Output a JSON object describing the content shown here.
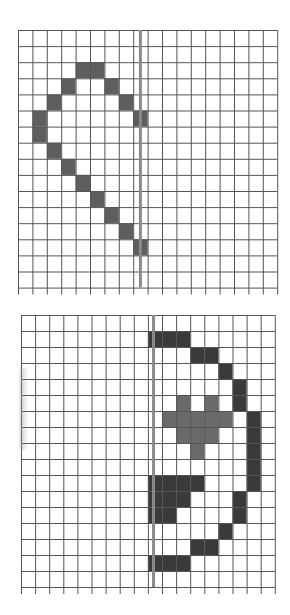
{
  "colors": {
    "grid_line": "#555555",
    "mirror_line": "#8a8a8a",
    "cell_dark": "#3a3a3a",
    "cell_medium": "#6a6a6a",
    "cell_top": "#5e5e5e",
    "background": "#ffffff"
  },
  "grids": [
    {
      "id": "top-grid",
      "x": 18,
      "y": 30,
      "cols": 18,
      "rows": 16,
      "cell_w": 14.4,
      "cell_h": 16.1,
      "mirror_x_col": 8.5,
      "cells": [
        {
          "r": 2,
          "c": 4,
          "tone": "top"
        },
        {
          "r": 2,
          "c": 5,
          "tone": "top"
        },
        {
          "r": 3,
          "c": 3,
          "tone": "top"
        },
        {
          "r": 3,
          "c": 6,
          "tone": "top"
        },
        {
          "r": 4,
          "c": 2,
          "tone": "top"
        },
        {
          "r": 4,
          "c": 7,
          "tone": "top"
        },
        {
          "r": 5,
          "c": 1,
          "tone": "top"
        },
        {
          "r": 5,
          "c": 8,
          "tone": "top"
        },
        {
          "r": 6,
          "c": 1,
          "tone": "top"
        },
        {
          "r": 7,
          "c": 2,
          "tone": "top"
        },
        {
          "r": 8,
          "c": 3,
          "tone": "top"
        },
        {
          "r": 9,
          "c": 4,
          "tone": "top"
        },
        {
          "r": 10,
          "c": 5,
          "tone": "top"
        },
        {
          "r": 11,
          "c": 6,
          "tone": "top"
        },
        {
          "r": 12,
          "c": 7,
          "tone": "top"
        },
        {
          "r": 13,
          "c": 8,
          "tone": "top"
        }
      ]
    },
    {
      "id": "bottom-grid",
      "x": 21,
      "y": 315,
      "cols": 18,
      "rows": 17,
      "cell_w": 14.1,
      "cell_h": 16.0,
      "mirror_x_col": 9.4,
      "cells": [
        {
          "r": 1,
          "c": 9,
          "tone": "dark"
        },
        {
          "r": 1,
          "c": 10,
          "tone": "dark"
        },
        {
          "r": 1,
          "c": 11,
          "tone": "dark"
        },
        {
          "r": 2,
          "c": 12,
          "tone": "dark"
        },
        {
          "r": 2,
          "c": 13,
          "tone": "dark"
        },
        {
          "r": 3,
          "c": 14,
          "tone": "dark"
        },
        {
          "r": 4,
          "c": 15,
          "tone": "dark"
        },
        {
          "r": 5,
          "c": 15,
          "tone": "dark"
        },
        {
          "r": 5,
          "c": 11,
          "tone": "medium"
        },
        {
          "r": 5,
          "c": 13,
          "tone": "medium"
        },
        {
          "r": 6,
          "c": 16,
          "tone": "dark"
        },
        {
          "r": 6,
          "c": 10,
          "tone": "medium"
        },
        {
          "r": 6,
          "c": 11,
          "tone": "medium"
        },
        {
          "r": 6,
          "c": 12,
          "tone": "medium"
        },
        {
          "r": 6,
          "c": 13,
          "tone": "medium"
        },
        {
          "r": 6,
          "c": 14,
          "tone": "medium"
        },
        {
          "r": 7,
          "c": 16,
          "tone": "dark"
        },
        {
          "r": 7,
          "c": 11,
          "tone": "medium"
        },
        {
          "r": 7,
          "c": 12,
          "tone": "medium"
        },
        {
          "r": 7,
          "c": 13,
          "tone": "medium"
        },
        {
          "r": 8,
          "c": 16,
          "tone": "dark"
        },
        {
          "r": 8,
          "c": 12,
          "tone": "medium"
        },
        {
          "r": 9,
          "c": 16,
          "tone": "dark"
        },
        {
          "r": 10,
          "c": 16,
          "tone": "dark"
        },
        {
          "r": 10,
          "c": 9,
          "tone": "dark"
        },
        {
          "r": 10,
          "c": 10,
          "tone": "dark"
        },
        {
          "r": 10,
          "c": 11,
          "tone": "dark"
        },
        {
          "r": 10,
          "c": 12,
          "tone": "dark"
        },
        {
          "r": 11,
          "c": 15,
          "tone": "dark"
        },
        {
          "r": 11,
          "c": 9,
          "tone": "dark"
        },
        {
          "r": 11,
          "c": 10,
          "tone": "dark"
        },
        {
          "r": 11,
          "c": 11,
          "tone": "dark"
        },
        {
          "r": 12,
          "c": 15,
          "tone": "dark"
        },
        {
          "r": 12,
          "c": 9,
          "tone": "dark"
        },
        {
          "r": 12,
          "c": 10,
          "tone": "dark"
        },
        {
          "r": 13,
          "c": 14,
          "tone": "dark"
        },
        {
          "r": 14,
          "c": 12,
          "tone": "dark"
        },
        {
          "r": 14,
          "c": 13,
          "tone": "dark"
        },
        {
          "r": 15,
          "c": 9,
          "tone": "dark"
        },
        {
          "r": 15,
          "c": 10,
          "tone": "dark"
        },
        {
          "r": 15,
          "c": 11,
          "tone": "dark"
        }
      ]
    }
  ]
}
